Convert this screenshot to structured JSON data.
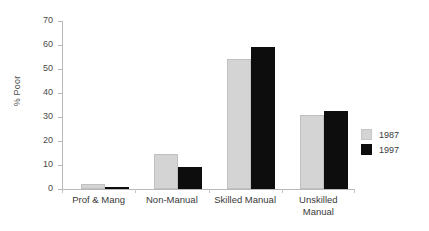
{
  "chart_data": {
    "type": "bar",
    "title": "",
    "xlabel": "",
    "ylabel": "% Poor",
    "ylim": [
      0,
      70
    ],
    "yticks": [
      0,
      10,
      20,
      30,
      40,
      50,
      60,
      70
    ],
    "ytick_labels": [
      "0",
      "10",
      "20",
      "30",
      "40",
      "50",
      "60",
      "70"
    ],
    "grid": false,
    "legend_position": "right",
    "categories": [
      "Prof & Mang",
      "Non-Manual",
      "Skilled Manual",
      "Unskilled\nManual"
    ],
    "series": [
      {
        "name": "1987",
        "color": "#d4d4d4",
        "values": [
          2,
          14.5,
          54,
          31
        ]
      },
      {
        "name": "1997",
        "color": "#0d0d0d",
        "values": [
          1,
          9,
          59,
          32.5
        ]
      }
    ]
  },
  "legend": {
    "items": [
      {
        "label": "1987",
        "swatch": "light-gray-swatch"
      },
      {
        "label": "1997",
        "swatch": "black-swatch"
      }
    ]
  }
}
